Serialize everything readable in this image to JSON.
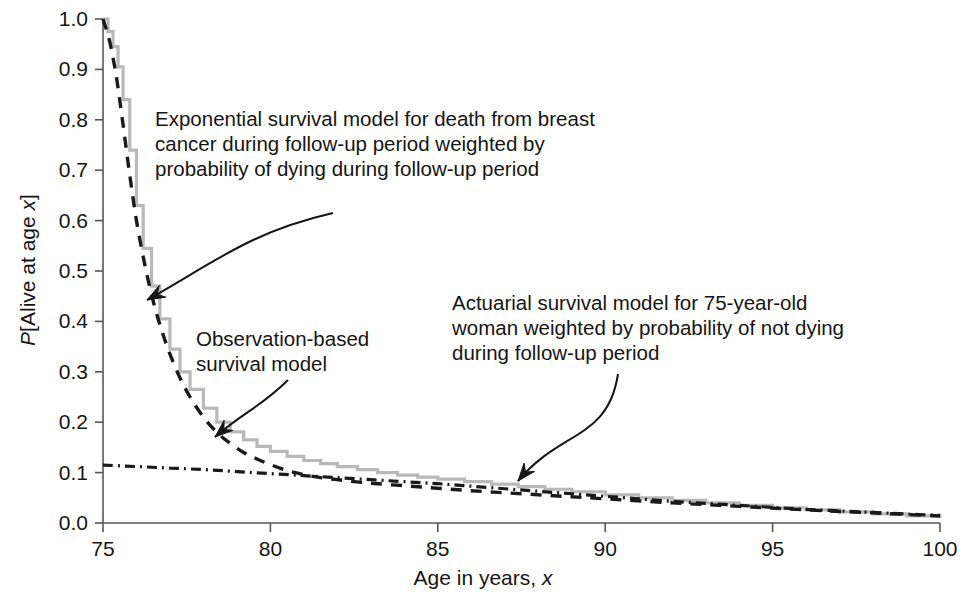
{
  "chart_data": {
    "type": "line",
    "title": "",
    "xlabel": "Age in years, x",
    "ylabel": "P[Alive at age x]",
    "xlim": [
      75,
      100
    ],
    "ylim": [
      0.0,
      1.0
    ],
    "xticks": [
      "75",
      "80",
      "85",
      "90",
      "95",
      "100"
    ],
    "yticks": [
      "0.0",
      "0.1",
      "0.2",
      "0.3",
      "0.4",
      "0.5",
      "0.6",
      "0.7",
      "0.8",
      "0.9",
      "1.0"
    ],
    "grid": false,
    "legend_position": "none",
    "series": [
      {
        "name": "Observation-based survival model",
        "style": "step",
        "color": "#b9b9b9",
        "x": [
          75.0,
          75.15,
          75.3,
          75.45,
          75.6,
          75.8,
          76.0,
          76.2,
          76.45,
          76.7,
          77.0,
          77.3,
          77.6,
          78.0,
          78.4,
          78.8,
          79.2,
          79.6,
          80.0,
          80.5,
          81.0,
          81.5,
          82.0,
          82.6,
          83.2,
          83.8,
          84.4,
          85.0,
          85.8,
          86.6,
          87.4,
          88.2,
          89.0,
          90.0,
          91.0,
          92.0,
          93.0,
          94.0,
          95.0,
          96.0,
          97.0,
          98.0,
          99.0,
          100.0
        ],
        "y": [
          1.0,
          0.975,
          0.945,
          0.905,
          0.84,
          0.74,
          0.63,
          0.545,
          0.47,
          0.405,
          0.345,
          0.3,
          0.265,
          0.228,
          0.2,
          0.181,
          0.165,
          0.152,
          0.142,
          0.132,
          0.124,
          0.118,
          0.112,
          0.106,
          0.1,
          0.095,
          0.091,
          0.087,
          0.082,
          0.077,
          0.072,
          0.067,
          0.062,
          0.056,
          0.05,
          0.045,
          0.04,
          0.035,
          0.03,
          0.026,
          0.022,
          0.018,
          0.014,
          0.01
        ]
      },
      {
        "name": "Exponential survival model for death from breast cancer",
        "style": "dashed",
        "color": "#1a1a1a",
        "x": [
          75.0,
          75.2,
          75.4,
          75.6,
          75.8,
          76.0,
          76.25,
          76.5,
          76.75,
          77.0,
          77.3,
          77.6,
          78.0,
          78.4,
          78.8,
          79.2,
          79.6,
          80.0,
          80.5,
          81.0,
          81.5,
          82.0,
          82.5,
          83.0,
          84.0,
          85.0,
          86.0,
          87.0,
          88.0,
          89.0,
          90.0,
          92.0,
          94.0,
          96.0,
          98.0,
          100.0
        ],
        "y": [
          1.0,
          0.955,
          0.885,
          0.79,
          0.69,
          0.6,
          0.512,
          0.44,
          0.383,
          0.335,
          0.288,
          0.25,
          0.21,
          0.18,
          0.158,
          0.14,
          0.127,
          0.116,
          0.104,
          0.096,
          0.09,
          0.086,
          0.082,
          0.079,
          0.074,
          0.069,
          0.064,
          0.06,
          0.056,
          0.052,
          0.048,
          0.04,
          0.033,
          0.026,
          0.02,
          0.014
        ]
      },
      {
        "name": "Actuarial survival model for 75-year-old woman",
        "style": "dashdot",
        "color": "#1a1a1a",
        "x": [
          75.0,
          76.0,
          77.0,
          78.0,
          79.0,
          80.0,
          81.0,
          82.0,
          83.0,
          84.0,
          85.0,
          86.0,
          87.0,
          88.0,
          89.0,
          90.0,
          91.0,
          92.0,
          93.0,
          94.0,
          95.0,
          96.0,
          97.0,
          98.0,
          99.0,
          100.0
        ],
        "y": [
          0.115,
          0.112,
          0.109,
          0.106,
          0.102,
          0.098,
          0.094,
          0.09,
          0.086,
          0.082,
          0.078,
          0.073,
          0.068,
          0.063,
          0.058,
          0.053,
          0.048,
          0.043,
          0.039,
          0.035,
          0.031,
          0.027,
          0.024,
          0.021,
          0.018,
          0.015
        ]
      }
    ],
    "annotations": [
      {
        "id": "exponential",
        "text": "Exponential survival model for death from breast\ncancer during follow-up period weighted by\nprobability of dying during follow-up period",
        "arrow_from": [
          330,
          212
        ],
        "arrow_to": [
          146,
          300
        ]
      },
      {
        "id": "observation",
        "text": "Observation-based\nsurvival model",
        "arrow_from": [
          285,
          382
        ],
        "arrow_to": [
          214,
          437
        ]
      },
      {
        "id": "actuarial",
        "text": "Actuarial survival model for 75-year-old\nwoman weighted by probability of not dying\nduring follow-up period",
        "arrow_from": [
          618,
          374
        ],
        "arrow_to": [
          517,
          482
        ]
      }
    ],
    "axis_color": "#555555"
  }
}
